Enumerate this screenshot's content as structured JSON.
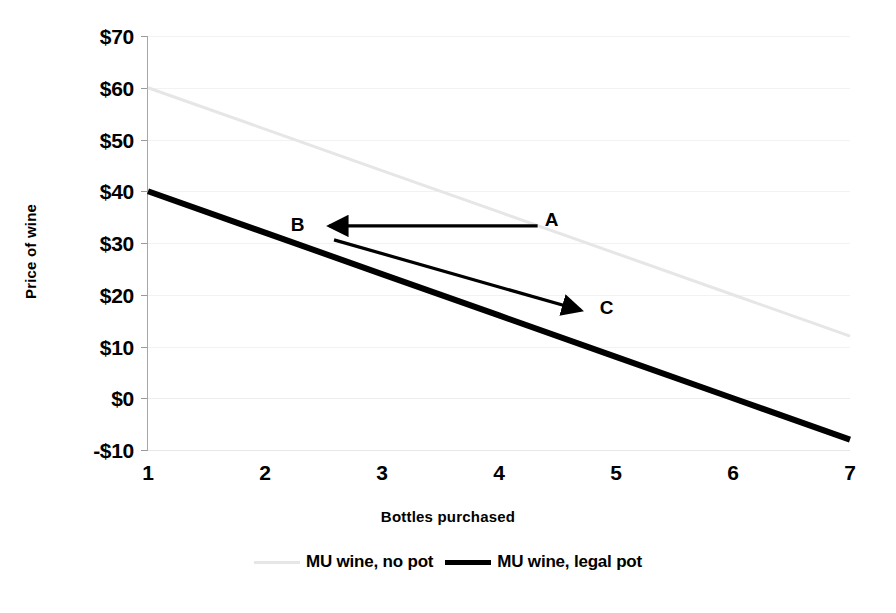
{
  "chart_data": {
    "type": "line",
    "title": "",
    "xlabel": "Bottles purchased",
    "ylabel": "Price of wine",
    "xlim": [
      1,
      7
    ],
    "ylim": [
      -10,
      70
    ],
    "x": [
      1,
      2,
      3,
      4,
      5,
      6,
      7
    ],
    "xticklabels": [
      "1",
      "2",
      "3",
      "4",
      "5",
      "6",
      "7"
    ],
    "yticks": [
      70,
      60,
      50,
      40,
      30,
      20,
      10,
      0,
      -10
    ],
    "yticklabels": [
      "$70",
      "$60",
      "$50",
      "$40",
      "$30",
      "$20",
      "$10",
      "$0",
      "-$10"
    ],
    "grid": true,
    "legend_position": "bottom",
    "series": [
      {
        "name": "MU wine, no pot",
        "color": "#e6e6e6",
        "width": 3,
        "values": [
          60,
          52,
          44,
          36,
          28,
          20,
          12
        ]
      },
      {
        "name": "MU wine, legal pot",
        "color": "#000000",
        "width": 6,
        "values": [
          40,
          32,
          24,
          16,
          8,
          0,
          -8
        ]
      }
    ],
    "annotations": [
      {
        "label": "A",
        "x": 4.45,
        "y": 34.5
      },
      {
        "label": "B",
        "x": 2.28,
        "y": 33.5
      },
      {
        "label": "C",
        "x": 4.92,
        "y": 17.5
      }
    ],
    "arrows": [
      {
        "name": "arrow-a-to-b",
        "from": {
          "x": 4.33,
          "y": 33.3
        },
        "to": {
          "x": 2.55,
          "y": 33.3
        },
        "color": "#000000"
      },
      {
        "name": "arrow-b-to-c",
        "from": {
          "x": 2.59,
          "y": 30.6
        },
        "to": {
          "x": 4.7,
          "y": 17.0
        },
        "color": "#000000"
      }
    ]
  },
  "axes": {
    "y_title": "Price of wine",
    "x_title": "Bottles purchased",
    "y_ticks": [
      "$70",
      "$60",
      "$50",
      "$40",
      "$30",
      "$20",
      "$10",
      "$0",
      "-$10"
    ],
    "x_ticks": [
      "1",
      "2",
      "3",
      "4",
      "5",
      "6",
      "7"
    ]
  },
  "legend": {
    "items": [
      {
        "label": "MU wine, no pot",
        "style": "light"
      },
      {
        "label": "MU wine, legal pot",
        "style": "dark"
      }
    ]
  },
  "annotations": {
    "a": "A",
    "b": "B",
    "c": "C"
  },
  "colors": {
    "no_pot_line": "#e6e6e6",
    "legal_pot_line": "#000000",
    "grid": "#f2f2f2",
    "axis": "#a6a6a6",
    "background": "#ffffff"
  }
}
